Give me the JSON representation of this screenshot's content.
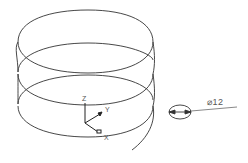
{
  "drawing": {
    "type": "3D helix wireframe",
    "turns": 3,
    "stroke_color": "#333333",
    "background": "#ffffff"
  },
  "axes": {
    "z_label": "Z",
    "y_label": "Y",
    "x_label": "X"
  },
  "dimension": {
    "symbol": "⌀",
    "value": "12",
    "text": "⌀12"
  }
}
